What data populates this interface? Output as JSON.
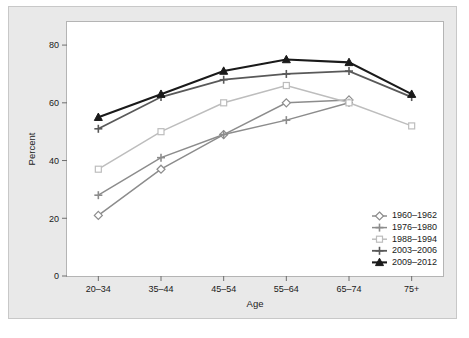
{
  "chart_data": {
    "type": "line",
    "title": "",
    "xlabel": "Age",
    "ylabel": "Percent",
    "categories": [
      "20–34",
      "35–44",
      "45–54",
      "55–64",
      "65–74",
      "75+"
    ],
    "ylim": [
      0,
      88
    ],
    "yticks": [
      0,
      20,
      40,
      60,
      80
    ],
    "grid": false,
    "legend_position": "bottom-right",
    "series": [
      {
        "name": "1960–1962",
        "color": "#8c8c8c",
        "marker": "diamond",
        "values": [
          21,
          37,
          49,
          60,
          61,
          null
        ]
      },
      {
        "name": "1976–1980",
        "color": "#8c8c8c",
        "marker": "plus",
        "values": [
          28,
          41,
          49,
          54,
          60,
          null
        ]
      },
      {
        "name": "1988–1994",
        "color": "#bdbdbd",
        "marker": "square",
        "values": [
          37,
          50,
          60,
          66,
          60,
          52
        ]
      },
      {
        "name": "2003–2006",
        "color": "#595959",
        "marker": "plus",
        "values": [
          51,
          62,
          68,
          70,
          71,
          62
        ]
      },
      {
        "name": "2009–2012",
        "color": "#1a1a1a",
        "marker": "triangle",
        "values": [
          55,
          63,
          71,
          75,
          74,
          63
        ]
      }
    ]
  }
}
